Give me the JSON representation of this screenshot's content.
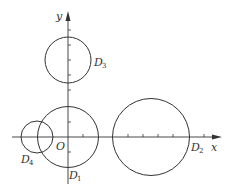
{
  "diagram": {
    "type": "coordinate-plane-with-circles",
    "axes": {
      "x_label": "x",
      "y_label": "y",
      "origin_label": "O",
      "tick_spacing_px": 15
    },
    "circles": [
      {
        "id": "D1",
        "letter": "D",
        "subscript": "1",
        "center": [
          0,
          0
        ],
        "radius_units": 2
      },
      {
        "id": "D2",
        "letter": "D",
        "subscript": "2",
        "center": [
          5.5,
          0
        ],
        "radius_units": 2.5
      },
      {
        "id": "D3",
        "letter": "D",
        "subscript": "3",
        "center": [
          0,
          5
        ],
        "radius_units": 1.5
      },
      {
        "id": "D4",
        "letter": "D",
        "subscript": "4",
        "center": [
          -2,
          0
        ],
        "radius_units": 1
      }
    ],
    "colors": {
      "stroke": "#333333",
      "background": "#ffffff"
    }
  }
}
